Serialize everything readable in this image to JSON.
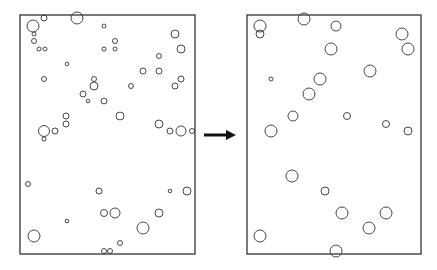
{
  "diagram": {
    "stroke_color": "#333333",
    "background": "#ffffff",
    "panels": [
      {
        "id": "before",
        "frame": {
          "x": 20,
          "y": 15,
          "w": 175,
          "h": 239
        },
        "circles": [
          {
            "cx": 33,
            "cy": 26,
            "r": 6
          },
          {
            "cx": 44,
            "cy": 18,
            "r": 3
          },
          {
            "cx": 77,
            "cy": 18,
            "r": 6
          },
          {
            "cx": 34,
            "cy": 34,
            "r": 2
          },
          {
            "cx": 34,
            "cy": 41,
            "r": 2.5
          },
          {
            "cx": 39,
            "cy": 49,
            "r": 2
          },
          {
            "cx": 45,
            "cy": 49,
            "r": 2
          },
          {
            "cx": 104,
            "cy": 26,
            "r": 2
          },
          {
            "cx": 115,
            "cy": 41,
            "r": 2.5
          },
          {
            "cx": 104,
            "cy": 49,
            "r": 2
          },
          {
            "cx": 115,
            "cy": 49,
            "r": 2
          },
          {
            "cx": 175,
            "cy": 34,
            "r": 4
          },
          {
            "cx": 181,
            "cy": 49,
            "r": 4
          },
          {
            "cx": 67,
            "cy": 64,
            "r": 1.8
          },
          {
            "cx": 159,
            "cy": 56,
            "r": 2.5
          },
          {
            "cx": 143,
            "cy": 71,
            "r": 3
          },
          {
            "cx": 159,
            "cy": 71,
            "r": 3
          },
          {
            "cx": 44,
            "cy": 79,
            "r": 2.5
          },
          {
            "cx": 94,
            "cy": 79,
            "r": 2.5
          },
          {
            "cx": 94,
            "cy": 86,
            "r": 4
          },
          {
            "cx": 131,
            "cy": 86,
            "r": 2.5
          },
          {
            "cx": 175,
            "cy": 86,
            "r": 3
          },
          {
            "cx": 181,
            "cy": 79,
            "r": 3
          },
          {
            "cx": 83,
            "cy": 94,
            "r": 3
          },
          {
            "cx": 88,
            "cy": 101,
            "r": 1.8
          },
          {
            "cx": 104,
            "cy": 101,
            "r": 3
          },
          {
            "cx": 66,
            "cy": 116,
            "r": 3
          },
          {
            "cx": 66,
            "cy": 124,
            "r": 3
          },
          {
            "cx": 120,
            "cy": 116,
            "r": 4
          },
          {
            "cx": 44,
            "cy": 131,
            "r": 5.5
          },
          {
            "cx": 55,
            "cy": 131,
            "r": 3
          },
          {
            "cx": 44,
            "cy": 139,
            "r": 2
          },
          {
            "cx": 159,
            "cy": 124,
            "r": 4
          },
          {
            "cx": 170,
            "cy": 131,
            "r": 3
          },
          {
            "cx": 181,
            "cy": 131,
            "r": 5
          },
          {
            "cx": 192,
            "cy": 131,
            "r": 2.5
          },
          {
            "cx": 28,
            "cy": 184,
            "r": 2.5
          },
          {
            "cx": 99,
            "cy": 191,
            "r": 3
          },
          {
            "cx": 170,
            "cy": 191,
            "r": 1.8
          },
          {
            "cx": 187,
            "cy": 191,
            "r": 4
          },
          {
            "cx": 104,
            "cy": 213,
            "r": 3.5
          },
          {
            "cx": 115,
            "cy": 213,
            "r": 5
          },
          {
            "cx": 159,
            "cy": 213,
            "r": 4
          },
          {
            "cx": 67,
            "cy": 221,
            "r": 1.8
          },
          {
            "cx": 143,
            "cy": 228,
            "r": 6
          },
          {
            "cx": 34,
            "cy": 236,
            "r": 6
          },
          {
            "cx": 120,
            "cy": 243,
            "r": 2.5
          },
          {
            "cx": 104,
            "cy": 251,
            "r": 2.5
          },
          {
            "cx": 110,
            "cy": 251,
            "r": 2.5
          }
        ]
      },
      {
        "id": "after",
        "frame": {
          "x": 247,
          "y": 15,
          "w": 174,
          "h": 239
        },
        "circles": [
          {
            "cx": 260,
            "cy": 26,
            "r": 6
          },
          {
            "cx": 260,
            "cy": 34,
            "r": 4
          },
          {
            "cx": 304,
            "cy": 19,
            "r": 6
          },
          {
            "cx": 336,
            "cy": 26,
            "r": 5
          },
          {
            "cx": 402,
            "cy": 34,
            "r": 6
          },
          {
            "cx": 408,
            "cy": 49,
            "r": 6
          },
          {
            "cx": 331,
            "cy": 49,
            "r": 6
          },
          {
            "cx": 370,
            "cy": 71,
            "r": 6
          },
          {
            "cx": 271,
            "cy": 79,
            "r": 2
          },
          {
            "cx": 320,
            "cy": 79,
            "r": 6
          },
          {
            "cx": 309,
            "cy": 94,
            "r": 6
          },
          {
            "cx": 293,
            "cy": 116,
            "r": 5
          },
          {
            "cx": 347,
            "cy": 116,
            "r": 3.5
          },
          {
            "cx": 386,
            "cy": 124,
            "r": 3.5
          },
          {
            "cx": 408,
            "cy": 131,
            "r": 4
          },
          {
            "cx": 271,
            "cy": 131,
            "r": 6
          },
          {
            "cx": 292,
            "cy": 176,
            "r": 6
          },
          {
            "cx": 325,
            "cy": 191,
            "r": 4
          },
          {
            "cx": 342,
            "cy": 213,
            "r": 6
          },
          {
            "cx": 386,
            "cy": 213,
            "r": 6
          },
          {
            "cx": 369,
            "cy": 228,
            "r": 6
          },
          {
            "cx": 260,
            "cy": 236,
            "r": 6
          },
          {
            "cx": 336,
            "cy": 251,
            "r": 6
          }
        ]
      }
    ],
    "arrow": {
      "x1": 204,
      "y1": 135,
      "x2": 236,
      "y2": 135,
      "color": "#111111",
      "direction": "right"
    }
  }
}
